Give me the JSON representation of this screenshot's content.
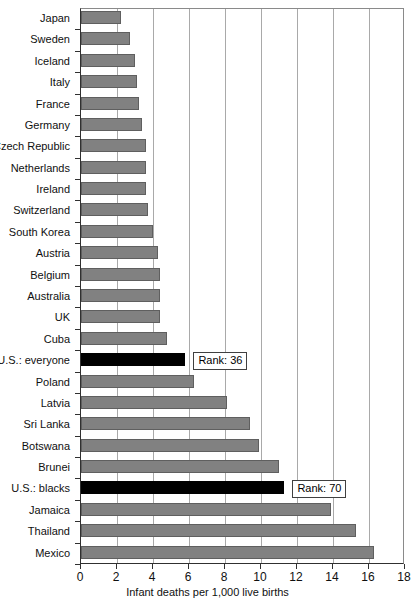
{
  "chart_data": {
    "type": "bar",
    "orientation": "horizontal",
    "title": "",
    "xlabel": "Infant deaths per 1,000 live births",
    "ylabel": "",
    "xlim": [
      0,
      18
    ],
    "xticks": [
      0,
      2,
      4,
      6,
      8,
      10,
      12,
      14,
      16,
      18
    ],
    "grid": true,
    "legend": "none",
    "categories": [
      "Japan",
      "Sweden",
      "Iceland",
      "Italy",
      "France",
      "Germany",
      "Czech Republic",
      "Netherlands",
      "Ireland",
      "Switzerland",
      "South Korea",
      "Austria",
      "Belgium",
      "Australia",
      "UK",
      "Cuba",
      "U.S.: everyone",
      "Poland",
      "Latvia",
      "Sri Lanka",
      "Botswana",
      "Brunei",
      "U.S.: blacks",
      "Jamaica",
      "Thailand",
      "Mexico"
    ],
    "values": [
      2.2,
      2.7,
      3.0,
      3.1,
      3.2,
      3.4,
      3.6,
      3.6,
      3.6,
      3.7,
      4.0,
      4.3,
      4.4,
      4.4,
      4.4,
      4.8,
      5.8,
      6.3,
      8.1,
      9.4,
      9.9,
      11.0,
      11.3,
      13.9,
      15.3,
      16.3
    ],
    "highlight_indices": [
      16,
      22
    ],
    "colors": {
      "bar": "#818181",
      "bar_highlight": "#000000",
      "background": "#ffffff",
      "gridline": "#a9a9a9",
      "axis": "#303030"
    },
    "annotations": [
      {
        "text": "Rank: 36",
        "category": "U.S.: everyone",
        "x": 6.3
      },
      {
        "text": "Rank: 70",
        "category": "U.S.: blacks",
        "x": 11.8
      }
    ]
  }
}
